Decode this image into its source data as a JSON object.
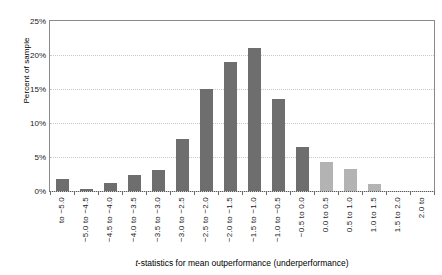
{
  "chart_data": {
    "type": "bar",
    "title": "",
    "xlabel": "t-statistics for mean outperformance (underperformance)",
    "ylabel": "Percent of sample",
    "categories": [
      "to −5.0",
      "−5.0 to −4.5",
      "−4.5 to −4.0",
      "−4.0 to −3.5",
      "−3.5 to −3.0",
      "−3.0 to −2.5",
      "−2.5 to −2.0",
      "−2.0 to −1.5",
      "−1.5 to −1.0",
      "−1.0 to −0.5",
      "−0.5 to 0.0",
      "0.0 to 0.5",
      "0.5 to 1.0",
      "1.0 to 1.5",
      "1.5 to 2.0",
      "2.0 to"
    ],
    "values": [
      1.7,
      0.3,
      1.2,
      2.4,
      3.1,
      7.6,
      15.0,
      19.0,
      21.0,
      13.5,
      6.4,
      4.2,
      3.2,
      1.0,
      0.0,
      0.0
    ],
    "bar_colors": [
      "#6e6e6e",
      "#6e6e6e",
      "#6e6e6e",
      "#6e6e6e",
      "#6e6e6e",
      "#6e6e6e",
      "#6e6e6e",
      "#6e6e6e",
      "#6e6e6e",
      "#6e6e6e",
      "#6e6e6e",
      "#b3b3b3",
      "#b3b3b3",
      "#b3b3b3",
      "#b3b3b3",
      "#b3b3b3"
    ],
    "ylim": [
      0,
      25
    ],
    "ytick_values": [
      0,
      5,
      10,
      15,
      20,
      25
    ],
    "ytick_labels": [
      "0%",
      "5%",
      "10%",
      "15%",
      "20%",
      "25%"
    ],
    "grid": true,
    "grid_axis": "y",
    "legend": null,
    "colors": {
      "dark_bar": "#6e6e6e",
      "light_bar": "#b3b3b3",
      "gridline": "#c9c9c9",
      "axis": "#5a5a5a",
      "text": "#1a1a1a",
      "background": "#ffffff"
    }
  }
}
